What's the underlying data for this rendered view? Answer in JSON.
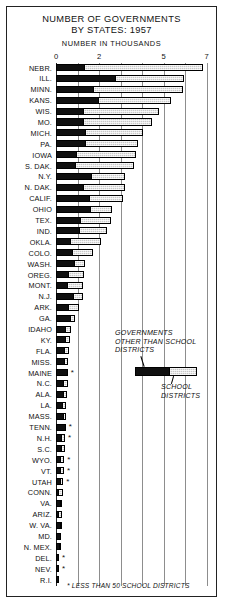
{
  "title": {
    "line1": "NUMBER OF GOVERNMENTS",
    "line2": "BY STATES: 1957",
    "subtitle": "NUMBER IN THOUSANDS"
  },
  "legend": {
    "other_label_line1": "GOVERNMENTS",
    "other_label_line2": "OTHER THAN SCHOOL",
    "other_label_line3": "DISTRICTS",
    "school_label_line1": "SCHOOL",
    "school_label_line2": "DISTRICTS"
  },
  "footnote": "* LESS THAN 50 SCHOOL DISTRICTS",
  "colors": {
    "other_governments": "#101010",
    "school_districts": "#c8c8c8",
    "frame": "#222222",
    "gridline": "#8d8d8d"
  },
  "chart_data": {
    "type": "bar",
    "orientation": "horizontal",
    "stacked": true,
    "title": "NUMBER OF GOVERNMENTS BY STATES: 1957",
    "xlabel": "NUMBER IN THOUSANDS",
    "ylabel": "",
    "xlim": [
      0,
      7.2
    ],
    "grid": true,
    "legend_position": "center-right",
    "tick_labels": [
      "0",
      "2",
      "5",
      "7"
    ],
    "tick_values": [
      0,
      2,
      5,
      7
    ],
    "gridline_values": [
      0,
      1,
      2,
      3,
      4,
      5,
      6,
      7
    ],
    "series": [
      {
        "name": "GOVERNMENTS OTHER THAN SCHOOL DISTRICTS",
        "color": "#101010"
      },
      {
        "name": "SCHOOL DISTRICTS",
        "color": "#c8c8c8"
      }
    ],
    "categories": [
      "NEBR.",
      "ILL.",
      "MINN.",
      "KANS.",
      "WIS.",
      "MO.",
      "MICH.",
      "PA.",
      "IOWA",
      "S. DAK.",
      "N.Y.",
      "N. DAK.",
      "CALIF.",
      "OHIO",
      "TEX.",
      "IND.",
      "OKLA.",
      "COLO.",
      "WASH.",
      "OREG.",
      "MONT.",
      "N.J.",
      "ARK.",
      "GA.",
      "IDAHO",
      "KY.",
      "FLA.",
      "MISS.",
      "MAINE",
      "N.C.",
      "ALA.",
      "LA.",
      "MASS.",
      "TENN.",
      "N.H.",
      "S.C.",
      "WYO.",
      "VT.",
      "UTAH",
      "CONN.",
      "VA.",
      "ARIZ.",
      "W. VA.",
      "MD.",
      "N. MEX.",
      "DEL.",
      "NEV.",
      "R.I."
    ],
    "rows": [
      {
        "state": "NEBR.",
        "other": 1.3,
        "school": 5.55,
        "total": 6.85,
        "footnote": false
      },
      {
        "state": "ILL.",
        "other": 2.75,
        "school": 3.2,
        "total": 5.95,
        "footnote": false
      },
      {
        "state": "MINN.",
        "other": 1.7,
        "school": 4.2,
        "total": 5.9,
        "footnote": false
      },
      {
        "state": "KANS.",
        "other": 1.95,
        "school": 3.4,
        "total": 5.35,
        "footnote": false
      },
      {
        "state": "WIS.",
        "other": 1.25,
        "school": 3.55,
        "total": 4.8,
        "footnote": false
      },
      {
        "state": "MO.",
        "other": 1.25,
        "school": 3.2,
        "total": 4.45,
        "footnote": false
      },
      {
        "state": "MICH.",
        "other": 1.35,
        "school": 2.7,
        "total": 4.05,
        "footnote": false
      },
      {
        "state": "PA.",
        "other": 1.35,
        "school": 2.45,
        "total": 3.8,
        "footnote": false
      },
      {
        "state": "IOWA",
        "other": 0.9,
        "school": 2.8,
        "total": 3.7,
        "footnote": false
      },
      {
        "state": "S. DAK.",
        "other": 0.85,
        "school": 2.75,
        "total": 3.6,
        "footnote": false
      },
      {
        "state": "N.Y.",
        "other": 1.65,
        "school": 1.55,
        "total": 3.2,
        "footnote": false
      },
      {
        "state": "N. DAK.",
        "other": 1.25,
        "school": 1.95,
        "total": 3.2,
        "footnote": false
      },
      {
        "state": "CALIF.",
        "other": 1.55,
        "school": 1.55,
        "total": 3.1,
        "footnote": false
      },
      {
        "state": "OHIO",
        "other": 1.6,
        "school": 1.0,
        "total": 2.6,
        "footnote": false
      },
      {
        "state": "TEX.",
        "other": 1.15,
        "school": 1.4,
        "total": 2.55,
        "footnote": false
      },
      {
        "state": "IND.",
        "other": 1.1,
        "school": 1.25,
        "total": 2.35,
        "footnote": false
      },
      {
        "state": "OKLA.",
        "other": 0.65,
        "school": 1.45,
        "total": 2.1,
        "footnote": false
      },
      {
        "state": "COLO.",
        "other": 0.75,
        "school": 0.95,
        "total": 1.7,
        "footnote": false
      },
      {
        "state": "WASH.",
        "other": 0.9,
        "school": 0.45,
        "total": 1.35,
        "footnote": false
      },
      {
        "state": "OREG.",
        "other": 0.55,
        "school": 0.75,
        "total": 1.3,
        "footnote": false
      },
      {
        "state": "MONT.",
        "other": 0.5,
        "school": 0.75,
        "total": 1.25,
        "footnote": false
      },
      {
        "state": "N.J.",
        "other": 0.85,
        "school": 0.4,
        "total": 1.25,
        "footnote": false
      },
      {
        "state": "ARK.",
        "other": 0.6,
        "school": 0.45,
        "total": 1.05,
        "footnote": false
      },
      {
        "state": "GA.",
        "other": 0.7,
        "school": 0.2,
        "total": 0.9,
        "footnote": false
      },
      {
        "state": "IDAHO",
        "other": 0.45,
        "school": 0.25,
        "total": 0.7,
        "footnote": false
      },
      {
        "state": "KY.",
        "other": 0.45,
        "school": 0.22,
        "total": 0.67,
        "footnote": false
      },
      {
        "state": "FLA.",
        "other": 0.42,
        "school": 0.18,
        "total": 0.6,
        "footnote": false
      },
      {
        "state": "MISS.",
        "other": 0.42,
        "school": 0.15,
        "total": 0.57,
        "footnote": false
      },
      {
        "state": "MAINE",
        "other": 0.55,
        "school": 0.0,
        "total": 0.55,
        "footnote": true
      },
      {
        "state": "N.C.",
        "other": 0.4,
        "school": 0.15,
        "total": 0.55,
        "footnote": false
      },
      {
        "state": "ALA.",
        "other": 0.38,
        "school": 0.14,
        "total": 0.52,
        "footnote": false
      },
      {
        "state": "LA.",
        "other": 0.35,
        "school": 0.12,
        "total": 0.47,
        "footnote": false
      },
      {
        "state": "MASS.",
        "other": 0.42,
        "school": 0.05,
        "total": 0.47,
        "footnote": false
      },
      {
        "state": "TENN.",
        "other": 0.45,
        "school": 0.0,
        "total": 0.45,
        "footnote": true
      },
      {
        "state": "N.H.",
        "other": 0.3,
        "school": 0.12,
        "total": 0.42,
        "footnote": true
      },
      {
        "state": "S.C.",
        "other": 0.28,
        "school": 0.12,
        "total": 0.4,
        "footnote": false
      },
      {
        "state": "WYO.",
        "other": 0.22,
        "school": 0.16,
        "total": 0.38,
        "footnote": true
      },
      {
        "state": "VT.",
        "other": 0.25,
        "school": 0.12,
        "total": 0.37,
        "footnote": true
      },
      {
        "state": "UTAH",
        "other": 0.22,
        "school": 0.12,
        "total": 0.34,
        "footnote": true
      },
      {
        "state": "CONN.",
        "other": 0.12,
        "school": 0.2,
        "total": 0.32,
        "footnote": false
      },
      {
        "state": "VA.",
        "other": 0.24,
        "school": 0.06,
        "total": 0.3,
        "footnote": false
      },
      {
        "state": "ARIZ.",
        "other": 0.12,
        "school": 0.16,
        "total": 0.28,
        "footnote": false
      },
      {
        "state": "W. VA.",
        "other": 0.25,
        "school": 0.02,
        "total": 0.27,
        "footnote": false
      },
      {
        "state": "MD.",
        "other": 0.24,
        "school": 0.0,
        "total": 0.24,
        "footnote": false
      },
      {
        "state": "N. MEX.",
        "other": 0.2,
        "school": 0.02,
        "total": 0.22,
        "footnote": false
      },
      {
        "state": "DEL.",
        "other": 0.13,
        "school": 0.0,
        "total": 0.13,
        "footnote": true
      },
      {
        "state": "NEV.",
        "other": 0.11,
        "school": 0.0,
        "total": 0.11,
        "footnote": true
      },
      {
        "state": "R.I.",
        "other": 0.09,
        "school": 0.0,
        "total": 0.09,
        "footnote": false
      }
    ]
  }
}
